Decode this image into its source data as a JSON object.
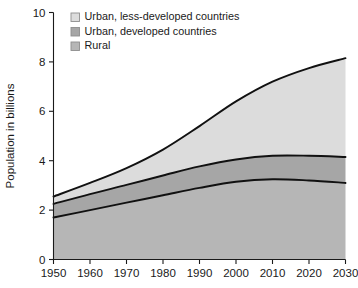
{
  "chart_data": {
    "type": "area",
    "title": "",
    "subtitle": "",
    "xlabel": "",
    "ylabel": "Population in billions",
    "stacked": true,
    "grid": false,
    "legend_position": "top-left",
    "xlim": [
      1950,
      2030
    ],
    "ylim": [
      0,
      10
    ],
    "xticks": [
      1950,
      1960,
      1970,
      1980,
      1990,
      2000,
      2010,
      2020,
      2030
    ],
    "yticks": [
      0,
      2,
      4,
      6,
      8,
      10
    ],
    "xtick_labels": [
      "1950",
      "1960",
      "1970",
      "1980",
      "1990",
      "2000",
      "2010",
      "2020",
      "2030"
    ],
    "ytick_labels": [
      "0",
      "2",
      "4",
      "6",
      "8",
      "10"
    ],
    "x": [
      1950,
      1960,
      1970,
      1980,
      1990,
      2000,
      2010,
      2020,
      2030
    ],
    "series": [
      {
        "name": "Rural",
        "color": "#b6b6b6",
        "values": [
          1.7,
          2.0,
          2.3,
          2.6,
          2.9,
          3.15,
          3.25,
          3.2,
          3.1
        ]
      },
      {
        "name": "Urban, developed countries",
        "color": "#a6a6a6",
        "values": [
          0.55,
          0.65,
          0.72,
          0.8,
          0.87,
          0.9,
          0.95,
          1.0,
          1.05
        ]
      },
      {
        "name": "Urban, less-developed countries",
        "color": "#dcdcdc",
        "values": [
          0.3,
          0.45,
          0.68,
          1.05,
          1.63,
          2.35,
          3.0,
          3.55,
          4.0
        ]
      }
    ],
    "cumulative_boundaries": {
      "rural_top": [
        1.7,
        2.0,
        2.3,
        2.6,
        2.9,
        3.15,
        3.25,
        3.2,
        3.1
      ],
      "urban_developed_top": [
        2.25,
        2.65,
        3.02,
        3.4,
        3.77,
        4.05,
        4.2,
        4.2,
        4.15
      ],
      "total_top": [
        2.55,
        3.1,
        3.7,
        4.45,
        5.4,
        6.4,
        7.2,
        7.75,
        8.15
      ]
    },
    "legend": [
      {
        "label": "Urban, less-developed countries",
        "color": "#dcdcdc"
      },
      {
        "label": "Urban, developed countries",
        "color": "#a6a6a6"
      },
      {
        "label": "Rural",
        "color": "#b6b6b6"
      }
    ]
  }
}
